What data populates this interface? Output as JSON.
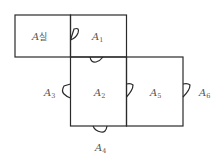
{
  "diagram": {
    "type": "floor-plan",
    "rooms": [
      {
        "id": "room-a-sil",
        "letter": "A",
        "suffix": "실",
        "label": "A실"
      },
      {
        "id": "room-a1",
        "letter": "A",
        "suffix": "1",
        "label": "A1"
      },
      {
        "id": "room-a2",
        "letter": "A",
        "suffix": "2",
        "label": "A2"
      },
      {
        "id": "room-a5",
        "letter": "A",
        "suffix": "5",
        "label": "A5"
      }
    ],
    "outside_labels": [
      {
        "id": "area-a3",
        "letter": "A",
        "suffix": "3",
        "label": "A3"
      },
      {
        "id": "area-a4",
        "letter": "A",
        "suffix": "4",
        "label": "A4"
      },
      {
        "id": "area-a6",
        "letter": "A",
        "suffix": "6",
        "label": "A6"
      }
    ],
    "doors": [
      {
        "between": [
          "A실",
          "A1"
        ]
      },
      {
        "between": [
          "A1",
          "A2"
        ]
      },
      {
        "between": [
          "A2",
          "A3"
        ]
      },
      {
        "between": [
          "A2",
          "A4"
        ]
      },
      {
        "between": [
          "A2",
          "A5"
        ]
      },
      {
        "between": [
          "A5",
          "A6"
        ]
      }
    ],
    "colors": {
      "line": "#2a2a2a",
      "text": "#555555",
      "background": "#ffffff"
    }
  }
}
